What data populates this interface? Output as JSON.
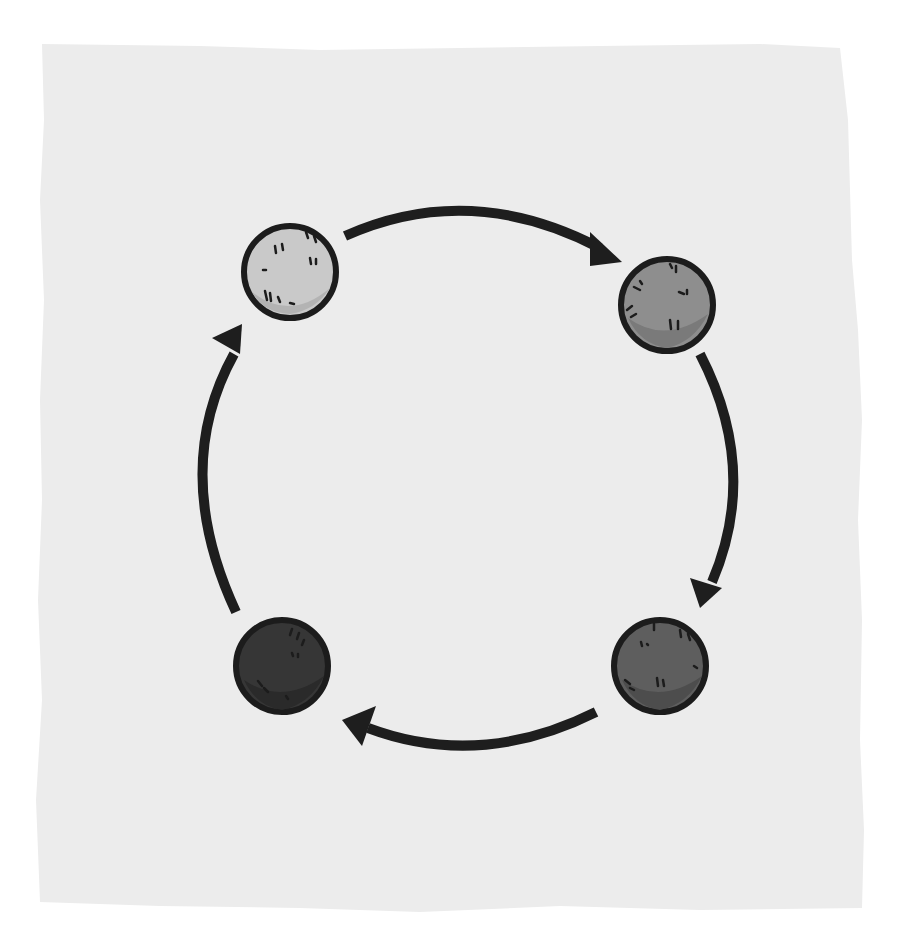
{
  "diagram": {
    "type": "cycle",
    "colors": {
      "page": "#ffffff",
      "paper": "#ececec",
      "outline": "#1c1c1c",
      "arrow": "#1e1e1e"
    },
    "nodes": [
      {
        "id": "top-left",
        "fill": "#c9c9c9",
        "shade": "#b3b3b3",
        "cx": 290,
        "cy": 272,
        "r": 46
      },
      {
        "id": "top-right",
        "fill": "#8e8e8e",
        "shade": "#7a7a7a",
        "cx": 667,
        "cy": 305,
        "r": 46
      },
      {
        "id": "bottom-right",
        "fill": "#5e5e5e",
        "shade": "#4d4d4d",
        "cx": 660,
        "cy": 666,
        "r": 46
      },
      {
        "id": "bottom-left",
        "fill": "#363636",
        "shade": "#2a2a2a",
        "cx": 282,
        "cy": 666,
        "r": 46
      }
    ],
    "arrows": [
      {
        "from": "top-left",
        "to": "top-right"
      },
      {
        "from": "top-right",
        "to": "bottom-right"
      },
      {
        "from": "bottom-right",
        "to": "bottom-left"
      },
      {
        "from": "bottom-left",
        "to": "top-left"
      }
    ]
  }
}
